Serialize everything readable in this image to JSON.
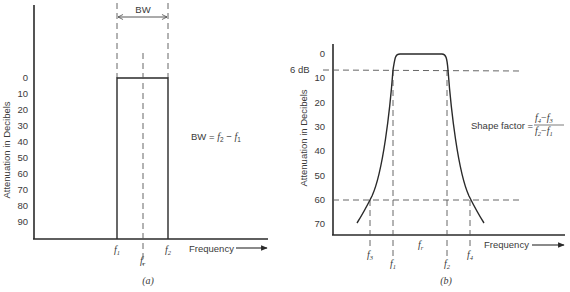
{
  "panel_a": {
    "caption": "(a)",
    "y_axis_label": "Attenuation in Decibels",
    "y_ticks": [
      "0",
      "10",
      "20",
      "30",
      "40",
      "50",
      "60",
      "70",
      "80",
      "90"
    ],
    "x_axis_label": "Frequency",
    "bw_label": "BW",
    "f1": "f",
    "f1_sub": "1",
    "f2": "f",
    "f2_sub": "2",
    "fr": "f",
    "fr_sub": "r",
    "formula": {
      "lhs": "BW = ",
      "t1": "f",
      "t1_sub": "2",
      "minus": " − ",
      "t2": "f",
      "t2_sub": "1"
    }
  },
  "panel_b": {
    "caption": "(b)",
    "y_axis_label": "Attenuation in Decibels",
    "y_ticks": [
      "0",
      "10",
      "20",
      "30",
      "40",
      "50",
      "60",
      "70"
    ],
    "marker_6db": "6 dB",
    "x_axis_label": "Frequency",
    "f1": "f",
    "f1_sub": "1",
    "f2": "f",
    "f2_sub": "2",
    "f3": "f",
    "f3_sub": "3",
    "f4": "f",
    "f4_sub": "4",
    "fr": "f",
    "fr_sub": "r",
    "formula": {
      "lhs": "Shape factor = ",
      "num_t1": "f",
      "num_t1_sub": "4",
      "num_t2": "f",
      "num_t2_sub": "3",
      "den_t1": "f",
      "den_t1_sub": "2",
      "den_t2": "f",
      "den_t2_sub": "1",
      "minus": "−"
    }
  }
}
